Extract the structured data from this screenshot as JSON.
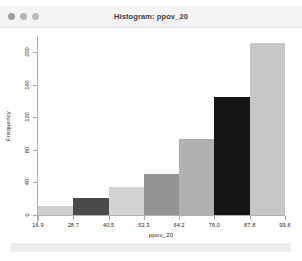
{
  "window": {
    "title": "Histogram: ppov_20",
    "traffic_lights": [
      "close-dot",
      "minimize-dot",
      "zoom-dot"
    ]
  },
  "colors": {
    "titlebar_bg": "#f4f4f4",
    "plot_bg": "#ffffff",
    "axis": "#b0b0b0",
    "footer": "#ececec"
  },
  "chart_data": {
    "type": "bar",
    "title": "Histogram: ppov_20",
    "xlabel": "ppov_20",
    "ylabel": "Frequency",
    "categories": [
      "16.9",
      "28.7",
      "40.5",
      "52.3",
      "64.2",
      "76.0",
      "87.8"
    ],
    "bin_edges": [
      16.9,
      28.7,
      40.5,
      52.3,
      64.2,
      76.0,
      87.8,
      99.6
    ],
    "values": [
      11,
      21,
      35,
      50,
      93,
      145,
      212
    ],
    "bar_colors": [
      "#cfcfcf",
      "#4a4a4a",
      "#d3d3d3",
      "#949494",
      "#b0b0b0",
      "#151515",
      "#c6c6c6"
    ],
    "xtick_labels": [
      "16.9",
      "28.7",
      "40.5",
      "52.3",
      "64.2",
      "76.0",
      "87.8",
      "99.6"
    ],
    "ytick_labels": [
      "0",
      "40",
      "80",
      "120",
      "160",
      "200"
    ],
    "ytick_values": [
      0,
      40,
      80,
      120,
      160,
      200
    ],
    "ylim": [
      0,
      220
    ],
    "xlim": [
      16.9,
      99.6
    ],
    "grid": false,
    "legend": null
  },
  "footer": {
    "label": ""
  }
}
